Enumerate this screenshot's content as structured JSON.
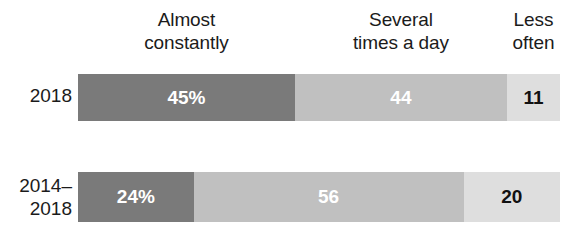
{
  "chart_data": {
    "type": "bar",
    "orientation": "horizontal",
    "stacked": true,
    "percent": true,
    "title": "",
    "xlabel": "",
    "ylabel": "",
    "xlim": [
      0,
      100
    ],
    "grid": false,
    "legend_position": "top",
    "categories": [
      "2018",
      "2014–2018"
    ],
    "series": [
      {
        "name": "Almost constantly",
        "values": [
          45,
          24
        ],
        "color": "#7a7a7a",
        "label_color": "#ffffff"
      },
      {
        "name": "Several times a day",
        "values": [
          44,
          56
        ],
        "color": "#c0c0c0",
        "label_color": "#ffffff"
      },
      {
        "name": "Less often",
        "values": [
          11,
          20
        ],
        "color": "#dedede",
        "label_color": "#111111"
      }
    ],
    "data_labels": [
      [
        "45%",
        "44",
        "11"
      ],
      [
        "24%",
        "56",
        "20"
      ]
    ]
  },
  "headers": [
    {
      "line1": "Almost",
      "line2": "constantly"
    },
    {
      "line1": "Several",
      "line2": "times a day"
    },
    {
      "line1": "Less",
      "line2": "often"
    }
  ],
  "rows": [
    {
      "label_line1": "2018",
      "label_line2": "",
      "segments": [
        {
          "name": "almost-constantly",
          "label": "45%",
          "value": 45
        },
        {
          "name": "several-times-a-day",
          "label": "44",
          "value": 44
        },
        {
          "name": "less-often",
          "label": "11",
          "value": 11
        }
      ]
    },
    {
      "label_line1": "2014–",
      "label_line2": "2018",
      "segments": [
        {
          "name": "almost-constantly",
          "label": "24%",
          "value": 24
        },
        {
          "name": "several-times-a-day",
          "label": "56",
          "value": 56
        },
        {
          "name": "less-often",
          "label": "20",
          "value": 20
        }
      ]
    }
  ],
  "colors": {
    "almost_constantly": "#7a7a7a",
    "several_times_a_day": "#c0c0c0",
    "less_often": "#dedede",
    "text": "#1b1b1b",
    "background": "#ffffff"
  }
}
